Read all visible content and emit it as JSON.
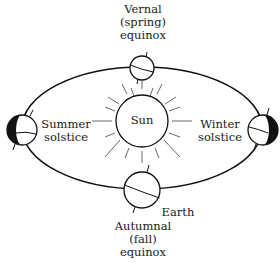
{
  "diagram": {
    "type": "earth-orbit-seasons",
    "sun": {
      "label": "Sun"
    },
    "earth_label": "Earth",
    "positions": [
      {
        "id": "vernal",
        "lines": [
          "Vernal",
          "(spring)",
          "equinox"
        ]
      },
      {
        "id": "summer",
        "lines": [
          "Summer",
          "solstice"
        ]
      },
      {
        "id": "winter",
        "lines": [
          "Winter",
          "solstice"
        ]
      },
      {
        "id": "autumnal",
        "lines": [
          "Autumnal",
          "(fall)",
          "equinox"
        ]
      }
    ],
    "colors": {
      "stroke": "#111111",
      "night": "#111111",
      "background": "#ffffff",
      "ray": "#555555"
    }
  }
}
